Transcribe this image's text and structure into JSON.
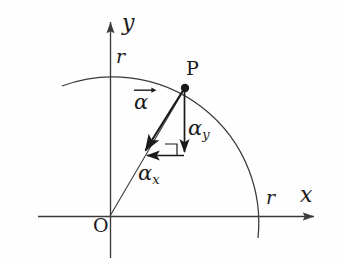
{
  "figure": {
    "background_color": "#fefefe",
    "stroke_color": "#262626",
    "axis_color": "#3a3a3a",
    "arc_color": "#3a3a3a"
  },
  "axes": {
    "x_axis_label": "x",
    "y_axis_label": "y",
    "origin_label": "O",
    "x_axis": {
      "x1": 38,
      "y1": 216,
      "x2": 320,
      "y2": 216
    },
    "y_axis": {
      "x1": 110,
      "y1": 17,
      "x2": 110,
      "y2": 258
    }
  },
  "arc": {
    "radius_label_y": "r",
    "radius_label_x": "r",
    "center_x": 110,
    "center_y": 216,
    "radius": 146,
    "start_x": 62,
    "start_y": 86,
    "end_x": 258,
    "end_y": 238
  },
  "point": {
    "label": "P",
    "x": 185,
    "y": 88
  },
  "vectors": [
    {
      "name": "alpha",
      "symbol": "α",
      "subscript": "",
      "accent": "overrightarrow",
      "label_text": "α",
      "from_x": 185,
      "from_y": 88,
      "to_x": 142,
      "to_y": 155
    },
    {
      "name": "alpha_y",
      "symbol": "α",
      "subscript": "y",
      "accent": "none",
      "label_text": "α",
      "from_x": 184,
      "from_y": 88,
      "to_x": 184,
      "to_y": 158
    },
    {
      "name": "alpha_x",
      "symbol": "α",
      "subscript": "x",
      "accent": "none",
      "label_text": "α",
      "from_x": 184,
      "from_y": 155,
      "to_x": 142,
      "to_y": 155
    }
  ],
  "right_angle_marker": {
    "x": 165,
    "y": 143,
    "size": 12
  },
  "radius_line": {
    "from_x": 110,
    "from_y": 216,
    "to_x": 185,
    "to_y": 88
  }
}
